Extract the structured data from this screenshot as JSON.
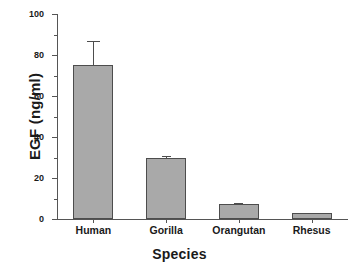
{
  "chart_data": {
    "type": "bar",
    "title": "",
    "xlabel": "Species",
    "ylabel": "EGF (ng/ml)",
    "categories": [
      "Human",
      "Gorilla",
      "Orangutan",
      "Rhesus"
    ],
    "values": [
      75,
      29.7,
      7.5,
      2.8
    ],
    "errors": [
      12,
      0.8,
      0.4,
      0.3
    ],
    "ylim": [
      0,
      100
    ],
    "yticks": [
      0,
      20,
      40,
      60,
      80,
      100
    ],
    "ytick_labels": [
      "0",
      "20",
      "40",
      "60",
      "80",
      "100"
    ],
    "yminor_ticks": [
      10,
      30,
      50,
      70,
      90
    ],
    "grid": false,
    "legend": null,
    "bar_color": "#a9a9a9",
    "bar_edge_color": "#4d4d4d",
    "axis_color": "#555555",
    "error_bar_style": "caps",
    "spines": [
      "left",
      "bottom"
    ],
    "tick_direction": "out"
  }
}
